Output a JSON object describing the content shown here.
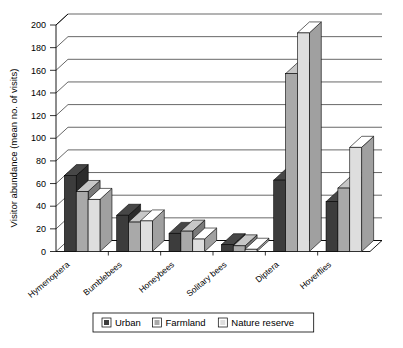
{
  "chart_data": {
    "type": "bar",
    "title": "",
    "subtitle": "",
    "xlabel": "",
    "ylabel": "Visitor abundance (mean no. of visits)",
    "ylim": [
      0,
      200
    ],
    "ytick_step": 20,
    "yticks": [
      0,
      20,
      40,
      60,
      80,
      100,
      120,
      140,
      160,
      180,
      200
    ],
    "ytick_labels": [
      "0",
      "20",
      "40",
      "60",
      "80",
      "100",
      "120",
      "140",
      "160",
      "180",
      "200"
    ],
    "grid": true,
    "grid_axis": "y",
    "style": "3d-clustered-column",
    "legend_position": "bottom",
    "categories": [
      "Hymenoptera",
      "Bumblebees",
      "Honeybees",
      "Solitary bees",
      "Diptera",
      "Hoverflies"
    ],
    "series": [
      {
        "name": "Urban",
        "color": "#3c3c3c",
        "values": [
          67,
          32,
          16,
          6,
          63,
          44
        ]
      },
      {
        "name": "Farmland",
        "color": "#a9a9a9",
        "values": [
          53,
          26,
          18,
          5,
          157,
          56
        ]
      },
      {
        "name": "Nature reserve",
        "color": "#dedede",
        "values": [
          46,
          27,
          11,
          2,
          193,
          92
        ]
      }
    ]
  },
  "legend": {
    "items": [
      {
        "label": "Urban",
        "color": "#3c3c3c"
      },
      {
        "label": "Farmland",
        "color": "#a9a9a9"
      },
      {
        "label": "Nature reserve",
        "color": "#dedede"
      }
    ]
  }
}
